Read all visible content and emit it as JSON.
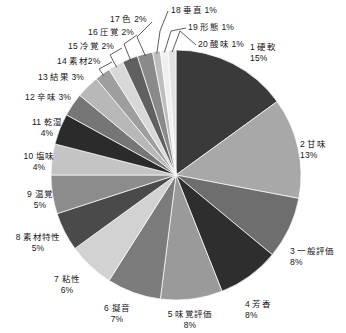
{
  "chart_data": {
    "type": "pie",
    "title": "",
    "subtitle": "",
    "xlabel": "",
    "ylabel": "",
    "legend_position": "callout-labels",
    "grid": false,
    "start_angle_deg": 0,
    "direction": "clockwise",
    "units": "%",
    "categories": [
      "硬軟",
      "甘味",
      "一般評価",
      "芳香",
      "味覚評価",
      "擬音",
      "粘性",
      "素材特性",
      "温覚",
      "塩味",
      "乾湿",
      "辛味",
      "結果",
      "素材",
      "冷覚",
      "圧覚",
      "色",
      "垂直",
      "形態",
      "酸味"
    ],
    "values": [
      15,
      13,
      8,
      8,
      8,
      7,
      6,
      5,
      5,
      4,
      4,
      3,
      3,
      2,
      2,
      2,
      2,
      1,
      1,
      1
    ],
    "colors": [
      "#3a3a3a",
      "#a8a8a8",
      "#6e6e6e",
      "#2e2e2e",
      "#9a9a9a",
      "#7c7c7c",
      "#d2d2d2",
      "#4a4a4a",
      "#8c8c8c",
      "#c4c4c4",
      "#2b2b2b",
      "#767676",
      "#b8b8b8",
      "#9e9e9e",
      "#d8d8d8",
      "#606060",
      "#8a8a8a",
      "#bdbdbd",
      "#f0f0f0",
      "#e2e2e2"
    ],
    "slices": [
      {
        "index": "1",
        "name": "硬軟",
        "percent": "15%",
        "value": 15,
        "color": "#3a3a3a"
      },
      {
        "index": "2",
        "name": "甘味",
        "percent": "13%",
        "value": 13,
        "color": "#a8a8a8"
      },
      {
        "index": "3",
        "name": "一般評価",
        "percent": "8%",
        "value": 8,
        "color": "#6e6e6e"
      },
      {
        "index": "4",
        "name": "芳香",
        "percent": "8%",
        "value": 8,
        "color": "#2e2e2e"
      },
      {
        "index": "5",
        "name": "味覚評価",
        "percent": "8%",
        "value": 8,
        "color": "#9a9a9a"
      },
      {
        "index": "6",
        "name": "擬音",
        "percent": "7%",
        "value": 7,
        "color": "#7c7c7c"
      },
      {
        "index": "7",
        "name": "粘性",
        "percent": "6%",
        "value": 6,
        "color": "#d2d2d2"
      },
      {
        "index": "8",
        "name": "素材特性",
        "percent": "5%",
        "value": 5,
        "color": "#4a4a4a"
      },
      {
        "index": "9",
        "name": "温覚",
        "percent": "5%",
        "value": 5,
        "color": "#8c8c8c"
      },
      {
        "index": "10",
        "name": "塩味",
        "percent": "4%",
        "value": 4,
        "color": "#c4c4c4"
      },
      {
        "index": "11",
        "name": "乾湿",
        "percent": "4%",
        "value": 4,
        "color": "#2b2b2b"
      },
      {
        "index": "12",
        "name": "辛味",
        "percent": "3%",
        "value": 3,
        "color": "#767676"
      },
      {
        "index": "13",
        "name": "結果",
        "percent": "3%",
        "value": 3,
        "color": "#b8b8b8"
      },
      {
        "index": "14",
        "name": "素材",
        "percent": "2%",
        "value": 2,
        "color": "#9e9e9e"
      },
      {
        "index": "15",
        "name": "冷覚",
        "percent": "2%",
        "value": 2,
        "color": "#d8d8d8"
      },
      {
        "index": "16",
        "name": "圧覚",
        "percent": "2%",
        "value": 2,
        "color": "#606060"
      },
      {
        "index": "17",
        "name": "色",
        "percent": "2%",
        "value": 2,
        "color": "#8a8a8a"
      },
      {
        "index": "18",
        "name": "垂直",
        "percent": "1%",
        "value": 1,
        "color": "#bdbdbd"
      },
      {
        "index": "19",
        "name": "形態",
        "percent": "1%",
        "value": 1,
        "color": "#f0f0f0"
      },
      {
        "index": "20",
        "name": "酸味",
        "percent": "1%",
        "value": 1,
        "color": "#e2e2e2"
      }
    ]
  },
  "labels": [
    {
      "id": "1",
      "text_name": "1 硬軟",
      "text_pct": "15%"
    },
    {
      "id": "2",
      "text_name": "2 甘味",
      "text_pct": "13%"
    },
    {
      "id": "3",
      "text_name": "3 一般評価",
      "text_pct": "8%"
    },
    {
      "id": "4",
      "text_name": "4 芳香",
      "text_pct": "8%"
    },
    {
      "id": "5",
      "text_name": "5 味覚評価",
      "text_pct": "8%"
    },
    {
      "id": "6",
      "text_name": "6 擬音",
      "text_pct": "7%"
    },
    {
      "id": "7",
      "text_name": "7 粘性",
      "text_pct": "6%"
    },
    {
      "id": "8",
      "text_name": "8 素材特性",
      "text_pct": "5%"
    },
    {
      "id": "9",
      "text_name": "9 温覚",
      "text_pct": "5%"
    },
    {
      "id": "10",
      "text_name": "10 塩味",
      "text_pct": "4%"
    },
    {
      "id": "11",
      "text_name": "11 乾湿",
      "text_pct": "4%"
    },
    {
      "id": "12",
      "text_name": "12 辛味 3%",
      "text_pct": ""
    },
    {
      "id": "13",
      "text_name": "13 結果 3%",
      "text_pct": ""
    },
    {
      "id": "14",
      "text_name": "14 素材2%",
      "text_pct": ""
    },
    {
      "id": "15",
      "text_name": "15 冷覚 2%",
      "text_pct": ""
    },
    {
      "id": "16",
      "text_name": "16 圧覚 2%",
      "text_pct": ""
    },
    {
      "id": "17",
      "text_name": "17 色 2%",
      "text_pct": ""
    },
    {
      "id": "18",
      "text_name": "18 垂直 1%",
      "text_pct": ""
    },
    {
      "id": "19",
      "text_name": "19 形態 1%",
      "text_pct": ""
    },
    {
      "id": "20",
      "text_name": "20 酸味 1%",
      "text_pct": ""
    }
  ]
}
